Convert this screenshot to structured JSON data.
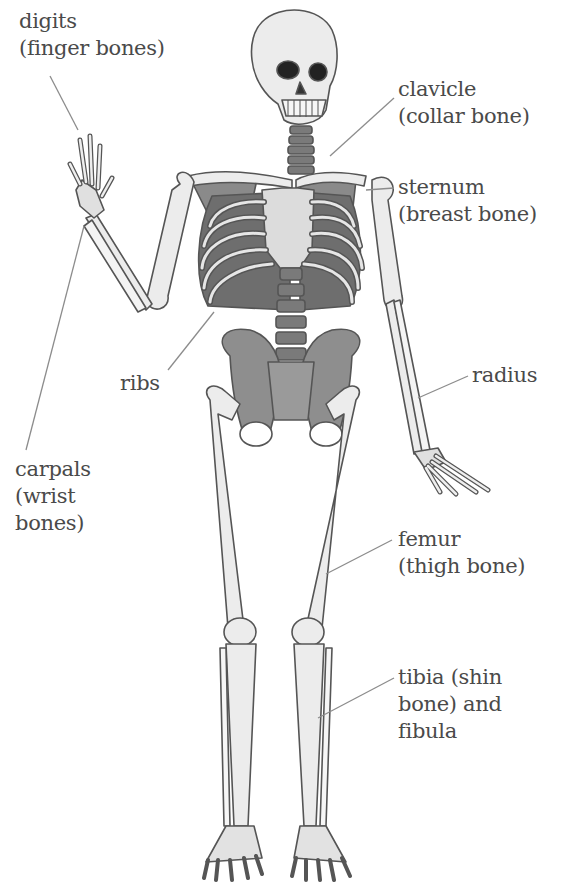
{
  "colors": {
    "bone_fill": "#ececec",
    "bone_stroke": "#555555",
    "shade": "#8a8a8a",
    "dark_shade": "#6a6a6a",
    "leader_line": "#8c8c8c",
    "label_text": "#4a4a4a"
  },
  "labels": {
    "digits": {
      "line1": "digits",
      "line2": "(finger bones)"
    },
    "clavicle": {
      "line1": "clavicle",
      "line2": "(collar bone)"
    },
    "sternum": {
      "line1": "sternum",
      "line2": "(breast bone)"
    },
    "ribs": {
      "line1": "ribs"
    },
    "radius": {
      "line1": "radius"
    },
    "carpals": {
      "line1": "carpals",
      "line2": "(wrist",
      "line3": "bones)"
    },
    "femur": {
      "line1": "femur",
      "line2": "(thigh bone)"
    },
    "tibia": {
      "line1": "tibia (shin",
      "line2": "bone) and",
      "line3": "fibula"
    }
  }
}
